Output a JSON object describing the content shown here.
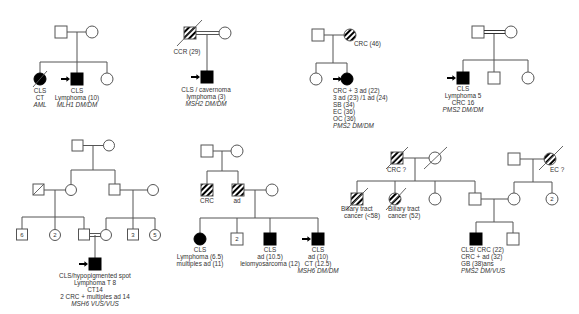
{
  "figure": {
    "pedigrees": [
      {
        "id": "family-1",
        "gene": "MLH1",
        "members": [
          {
            "role": "father",
            "sex": "male",
            "status": "unaffected"
          },
          {
            "role": "mother",
            "sex": "female",
            "status": "unaffected"
          },
          {
            "role": "sister",
            "sex": "female",
            "status": "affected",
            "deceased": true,
            "labels": [
              "CLS",
              "CT",
              "AML"
            ],
            "italic_last": true
          },
          {
            "role": "proband",
            "sex": "male",
            "status": "affected",
            "labels": [
              "CLS",
              "Lymphoma (10)",
              "MLH1 DM/DM"
            ],
            "italic_last": true
          },
          {
            "role": "sister",
            "sex": "female",
            "status": "unaffected"
          }
        ]
      },
      {
        "id": "family-2",
        "gene": "MSH2",
        "consanguineous": true,
        "members": [
          {
            "role": "father",
            "sex": "male",
            "status": "carrier-hatched",
            "deceased": true,
            "labels": [
              "CCR (29)"
            ]
          },
          {
            "role": "mother",
            "sex": "female",
            "status": "unaffected"
          },
          {
            "role": "proband",
            "sex": "male",
            "status": "affected",
            "labels": [
              "CLS / cavernoma",
              "lymphoma (3)",
              "MSH2 DM/DM"
            ],
            "italic_last": true
          }
        ]
      },
      {
        "id": "family-3",
        "gene": "PMS2",
        "members": [
          {
            "role": "father",
            "sex": "male",
            "status": "unaffected"
          },
          {
            "role": "mother",
            "sex": "female",
            "status": "carrier-hatched",
            "labels": [
              "CRC (46)"
            ]
          },
          {
            "role": "sister",
            "sex": "female",
            "status": "unaffected"
          },
          {
            "role": "proband",
            "sex": "female",
            "status": "affected",
            "labels": [
              "CRC + 3 ad (22)",
              "3 ad (23) /1 ad (24)",
              "SB (34)",
              "EC (36)",
              "OC (36)",
              "PMS2 DM/DM"
            ],
            "italic_last": true
          }
        ]
      },
      {
        "id": "family-4",
        "gene": "PMS2",
        "consanguineous": true,
        "members": [
          {
            "role": "father",
            "sex": "male",
            "status": "unaffected"
          },
          {
            "role": "mother",
            "sex": "female",
            "status": "unaffected"
          },
          {
            "role": "proband",
            "sex": "male",
            "status": "affected",
            "labels": [
              "CLS",
              "Lymphoma 5",
              "CRC 16",
              "PMS2 DM/DM"
            ],
            "italic_last": true
          },
          {
            "role": "brother",
            "sex": "male",
            "status": "unaffected"
          },
          {
            "role": "sister",
            "sex": "female",
            "status": "unaffected"
          }
        ]
      },
      {
        "id": "family-5",
        "gene": "MSH6",
        "consanguineous": true,
        "members": [
          {
            "role": "grandfather",
            "sex": "male",
            "status": "unaffected"
          },
          {
            "role": "grandmother",
            "sex": "female",
            "status": "unaffected"
          },
          {
            "role": "paternal-grandfather",
            "sex": "male",
            "status": "unaffected",
            "deceased": true
          },
          {
            "role": "paternal-grandmother",
            "sex": "female",
            "status": "unaffected"
          },
          {
            "role": "maternal-grandfather",
            "sex": "male",
            "status": "unaffected"
          },
          {
            "role": "maternal-grandmother",
            "sex": "female",
            "status": "unaffected"
          },
          {
            "role": "brothers",
            "sex": "male",
            "status": "unaffected",
            "count": "6"
          },
          {
            "role": "sisters",
            "sex": "female",
            "status": "unaffected",
            "count": "2"
          },
          {
            "role": "father",
            "sex": "male",
            "status": "unaffected"
          },
          {
            "role": "mother",
            "sex": "female",
            "status": "unaffected"
          },
          {
            "role": "uncles",
            "sex": "male",
            "status": "unaffected",
            "count": "3"
          },
          {
            "role": "aunts",
            "sex": "female",
            "status": "unaffected",
            "count": "5"
          },
          {
            "role": "proband",
            "sex": "male",
            "status": "affected",
            "labels": [
              "CLS/hypopigmented spot",
              "Lymphoma T 8",
              "CT14",
              "2 CRC + multiples ad 14",
              "MSH6 VUS/VUS"
            ],
            "italic_last": true
          }
        ]
      },
      {
        "id": "family-6",
        "gene": "MSH6",
        "members": [
          {
            "role": "grandfather",
            "sex": "male",
            "status": "unaffected"
          },
          {
            "role": "grandmother",
            "sex": "female",
            "status": "unaffected"
          },
          {
            "role": "uncle",
            "sex": "male",
            "status": "carrier-hatched",
            "labels": [
              "CRC"
            ]
          },
          {
            "role": "father",
            "sex": "male",
            "status": "carrier-hatched",
            "labels": [
              "ad"
            ]
          },
          {
            "role": "mother",
            "sex": "female",
            "status": "unaffected"
          },
          {
            "role": "sister",
            "sex": "female",
            "status": "affected",
            "labels": [
              "CLS",
              "Lymphoma (6.5)",
              "multiples ad (11)"
            ]
          },
          {
            "role": "brothers",
            "sex": "male",
            "status": "unaffected",
            "count": "2"
          },
          {
            "role": "brother",
            "sex": "male",
            "status": "affected",
            "labels": [
              "CLS",
              "ad (10.5)",
              "leiomyosarcoma (12)"
            ]
          },
          {
            "role": "proband",
            "sex": "male",
            "status": "affected",
            "labels": [
              "CLS",
              "ad (10)",
              "CT (12.5)",
              "MSH6 DM/DM"
            ],
            "italic_last": true
          }
        ]
      },
      {
        "id": "family-7",
        "gene": "PMS2",
        "members": [
          {
            "role": "paternal-grandfather",
            "sex": "male",
            "status": "carrier-hatched",
            "deceased": true,
            "labels": [
              "CRC ?"
            ]
          },
          {
            "role": "paternal-grandmother",
            "sex": "female",
            "status": "unaffected",
            "deceased": true
          },
          {
            "role": "uncle",
            "sex": "male",
            "status": "carrier-hatched",
            "deceased": true,
            "labels": [
              "Biliary tract",
              "cancer (<58)"
            ]
          },
          {
            "role": "aunt",
            "sex": "female",
            "status": "carrier-hatched",
            "deceased": true,
            "labels": [
              "Biliary tract",
              "cancer (52)"
            ]
          },
          {
            "role": "aunt",
            "sex": "female",
            "status": "unaffected"
          },
          {
            "role": "father",
            "sex": "male",
            "status": "unaffected"
          },
          {
            "role": "maternal-grandfather",
            "sex": "male",
            "status": "unaffected"
          },
          {
            "role": "maternal-grandmother",
            "sex": "female",
            "status": "carrier-hatched",
            "deceased": true,
            "labels": [
              "EC ?"
            ]
          },
          {
            "role": "mother",
            "sex": "female",
            "status": "unaffected"
          },
          {
            "role": "aunts",
            "sex": "female",
            "status": "unaffected",
            "count": "2"
          },
          {
            "role": "proband",
            "sex": "male",
            "status": "affected",
            "labels": [
              "CLS/ CRC (22)",
              "CRC + ad (32)",
              "GB (38)ans",
              "PMS2 DM/VUS"
            ],
            "italic_last": true
          },
          {
            "role": "brother",
            "sex": "male",
            "status": "unaffected"
          }
        ]
      }
    ],
    "text": {
      "f1": [
        "CLS",
        "CT",
        "AML",
        "CLS",
        "Lymphoma (10)",
        "MLH1 DM/DM"
      ],
      "f2": [
        "CCR (29)",
        "CLS / cavernoma",
        "lymphoma (3)",
        "MSH2 DM/DM"
      ],
      "f3": [
        "CRC (46)",
        "CRC + 3 ad (22)",
        "3 ad (23) /1 ad (24)",
        "SB (34)",
        "EC (36)",
        "OC (36)",
        "PMS2 DM/DM"
      ],
      "f4": [
        "CLS",
        "Lymphoma 5",
        "CRC 16",
        "PMS2 DM/DM"
      ],
      "f5": [
        "6",
        "2",
        "3",
        "5",
        "CLS/hypopigmented spot",
        "Lymphoma T 8",
        "CT14",
        "2 CRC + multiples ad 14",
        "MSH6 VUS/VUS"
      ],
      "f6": [
        "CRC",
        "ad",
        "CLS",
        "Lymphoma (6.5)",
        "multiples ad (11)",
        "2",
        "CLS",
        "ad (10.5)",
        "leiomyosarcoma (12)",
        "CLS",
        "ad (10)",
        "CT (12.5)",
        "MSH6 DM/DM"
      ],
      "f7": [
        "CRC ?",
        "Biliary tract",
        "cancer (<58)",
        "Biliary tract",
        "cancer (52)",
        "EC ?",
        "2",
        "CLS/ CRC (22)",
        "CRC + ad (32)",
        "GB (38)ans",
        "PMS2 DM/VUS"
      ]
    },
    "colors": {
      "line": "#555555",
      "affected": "#000000",
      "text": "#333333"
    }
  }
}
